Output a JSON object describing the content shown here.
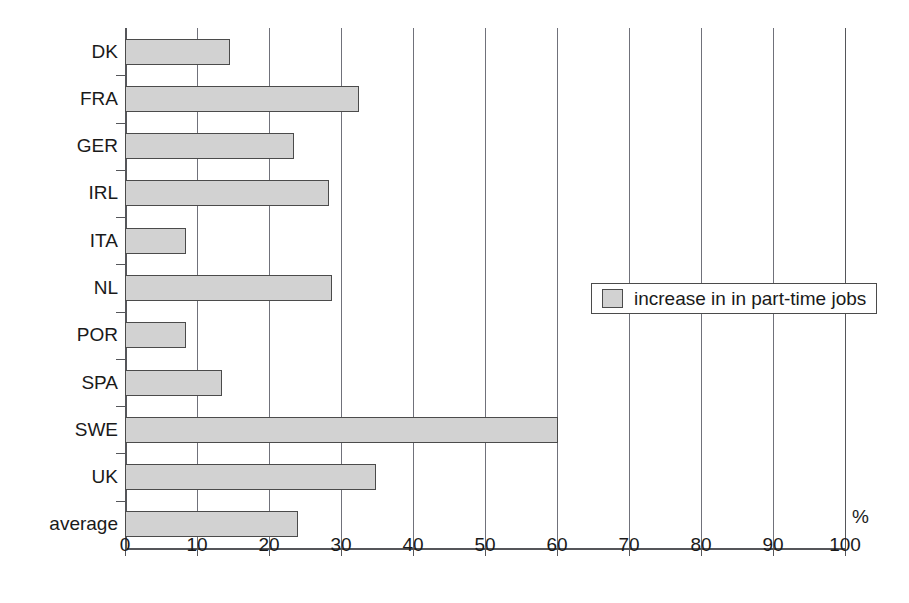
{
  "chart_data": {
    "type": "bar",
    "orientation": "horizontal",
    "title": "",
    "subtitle": "",
    "xlabel": "%",
    "ylabel": "",
    "xlim": [
      0,
      100
    ],
    "xticks": [
      0,
      10,
      20,
      30,
      40,
      50,
      60,
      70,
      80,
      90,
      100
    ],
    "xtick_labels": [
      "0",
      "10",
      "20",
      "30",
      "40",
      "50",
      "60",
      "70",
      "80",
      "90",
      "100"
    ],
    "grid": "vertical",
    "legend_position": "middle-right-inside",
    "legend": [
      "increase in in part-time jobs"
    ],
    "categories": [
      "DK",
      "FRA",
      "GER",
      "IRL",
      "ITA",
      "NL",
      "POR",
      "SPA",
      "SWE",
      "UK",
      "average"
    ],
    "values": [
      14.6,
      32.5,
      23.5,
      28.3,
      8.5,
      28.8,
      8.5,
      13.5,
      60.2,
      34.9,
      24.0
    ],
    "series": [
      {
        "name": "increase in in part-time jobs",
        "values": [
          14.6,
          32.5,
          23.5,
          28.3,
          8.5,
          28.8,
          8.5,
          13.5,
          60.2,
          34.9,
          24.0
        ]
      }
    ],
    "unit": "%",
    "colors": {
      "bar_fill": "#d2d2d2",
      "bar_stroke": "#4b4b4b",
      "axis": "#55565a",
      "grid": "#70717a",
      "text": "#1a1a1a",
      "background": "#ffffff"
    }
  }
}
